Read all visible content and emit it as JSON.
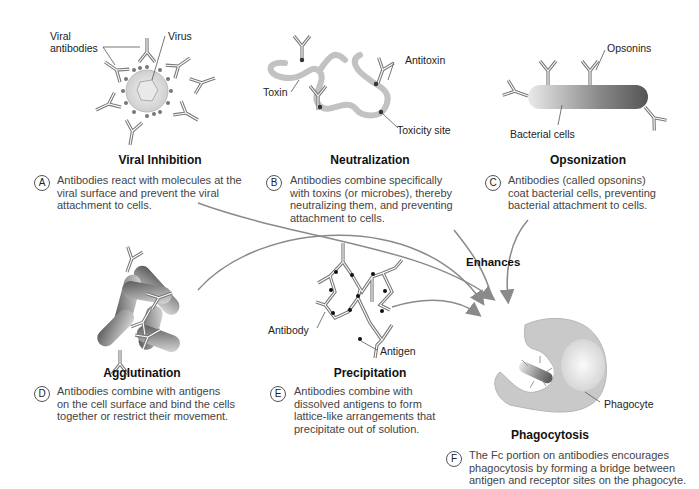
{
  "panels": [
    {
      "id": "A",
      "title": "Viral Inhibition",
      "description_lines": [
        "Antibodies react with molecules at the",
        "viral surface and prevent the viral",
        "attachment to cells."
      ],
      "labels": [
        "Viral",
        "antibodies",
        "Virus"
      ]
    },
    {
      "id": "B",
      "title": "Neutralization",
      "description_lines": [
        "Antibodies combine specifically",
        "with toxins (or microbes), thereby",
        "neutralizing them, and preventing",
        "attachment to cells."
      ],
      "labels": [
        "Toxin",
        "Antitoxin",
        "Toxicity site"
      ]
    },
    {
      "id": "C",
      "title": "Opsonization",
      "description_lines": [
        "Antibodies (called opsonins)",
        "coat bacterial cells, preventing",
        "bacterial attachment to cells."
      ],
      "labels": [
        "Opsonins",
        "Bacterial cells"
      ]
    },
    {
      "id": "D",
      "title": "Agglutination",
      "description_lines": [
        "Antibodies combine with antigens",
        "on the cell surface and bind the cells",
        "together or restrict their movement."
      ],
      "labels": []
    },
    {
      "id": "E",
      "title": "Precipitation",
      "description_lines": [
        "Antibodies combine with",
        "dissolved antigens to form",
        "lattice-like arrangements that",
        "precipitate out of solution."
      ],
      "labels": [
        "Antibody",
        "Antigen"
      ]
    },
    {
      "id": "F",
      "title": "Phagocytosis",
      "description_lines": [
        "The Fc portion on antibodies encourages",
        "phagocytosis by forming a bridge between",
        "antigen and receptor sites on the phagocyte."
      ],
      "labels": [
        "Phagocyte"
      ]
    }
  ],
  "arrows": {
    "label": "Enhances",
    "color": "#8a8a8a"
  },
  "colors": {
    "antibody": "#777777",
    "toxin": "#bdbdbd",
    "phagocyte": "#c9c9c9",
    "text": "#444444"
  }
}
